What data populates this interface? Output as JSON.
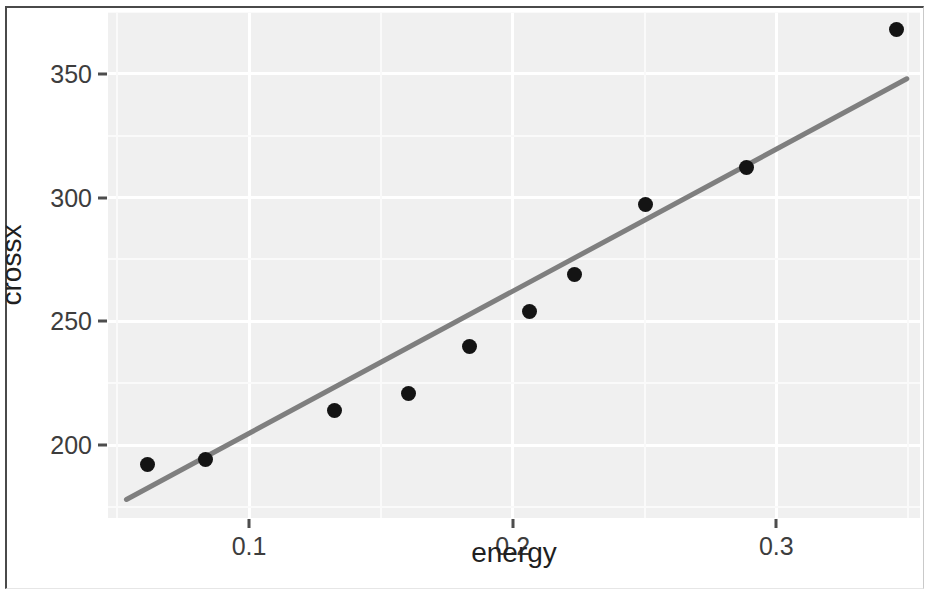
{
  "chart_data": {
    "type": "scatter",
    "title": "",
    "xlabel": "energy",
    "ylabel": "crossx",
    "xlim": [
      0.0465,
      0.3545
    ],
    "ylim": [
      170.5,
      375.0
    ],
    "grid": true,
    "legend": null,
    "x_ticks": [
      "0.1",
      "0.2",
      "0.3"
    ],
    "x_tick_values": [
      0.1,
      0.2,
      0.3
    ],
    "y_ticks": [
      "200",
      "250",
      "300",
      "350"
    ],
    "y_tick_values": [
      200,
      250,
      300,
      350
    ],
    "x": [
      0.0615,
      0.0835,
      0.1325,
      0.1605,
      0.1835,
      0.2065,
      0.2235,
      0.2505,
      0.2885,
      0.3455
    ],
    "y": [
      192,
      194,
      214,
      221,
      240,
      254,
      269,
      297,
      312,
      368
    ],
    "points": [
      {
        "x": 0.0615,
        "y": 192
      },
      {
        "x": 0.0835,
        "y": 194
      },
      {
        "x": 0.1325,
        "y": 214
      },
      {
        "x": 0.1605,
        "y": 221
      },
      {
        "x": 0.1835,
        "y": 240
      },
      {
        "x": 0.2065,
        "y": 254
      },
      {
        "x": 0.2235,
        "y": 269
      },
      {
        "x": 0.2505,
        "y": 297
      },
      {
        "x": 0.2885,
        "y": 312
      },
      {
        "x": 0.3455,
        "y": 368
      }
    ],
    "series": [
      {
        "name": "observations",
        "type": "scatter",
        "marker": "filled-circle",
        "color": "#141414",
        "x": [
          0.0615,
          0.0835,
          0.1325,
          0.1605,
          0.1835,
          0.2065,
          0.2235,
          0.2505,
          0.2885,
          0.3455
        ],
        "y": [
          192,
          194,
          214,
          221,
          240,
          254,
          269,
          297,
          312,
          368
        ]
      },
      {
        "name": "linear fit",
        "type": "line",
        "color": "#7f7f7f",
        "x": [
          0.0535,
          0.3495
        ],
        "y": [
          178,
          348
        ]
      }
    ],
    "fit_line": {
      "x_start": 0.0535,
      "y_start": 178,
      "x_end": 0.3495,
      "y_end": 348,
      "color": "#7f7f7f",
      "width": 5
    },
    "panel_background": "#f0f0f0",
    "gridline_color": "#ffffff"
  },
  "axes": {
    "x_title": "energy",
    "y_title": "crossx"
  }
}
